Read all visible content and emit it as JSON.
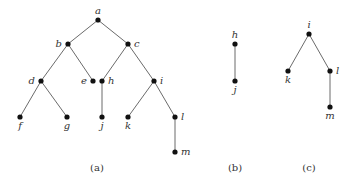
{
  "figures": [
    {
      "id": "a",
      "caption": "(a)",
      "nodes": [
        "a",
        "b",
        "c",
        "d",
        "e",
        "h",
        "i",
        "f",
        "g",
        "j",
        "k",
        "l",
        "m"
      ],
      "edges": [
        [
          "a",
          "b"
        ],
        [
          "a",
          "c"
        ],
        [
          "b",
          "d"
        ],
        [
          "b",
          "e"
        ],
        [
          "c",
          "h"
        ],
        [
          "c",
          "i"
        ],
        [
          "d",
          "f"
        ],
        [
          "d",
          "g"
        ],
        [
          "h",
          "j"
        ],
        [
          "i",
          "k"
        ],
        [
          "i",
          "l"
        ],
        [
          "l",
          "m"
        ]
      ]
    },
    {
      "id": "b",
      "caption": "(b)",
      "nodes": [
        "h",
        "j"
      ],
      "edges": [
        [
          "h",
          "j"
        ]
      ]
    },
    {
      "id": "c",
      "caption": "(c)",
      "nodes": [
        "i",
        "k",
        "l",
        "m"
      ],
      "edges": [
        [
          "i",
          "k"
        ],
        [
          "i",
          "l"
        ],
        [
          "l",
          "m"
        ]
      ]
    }
  ]
}
